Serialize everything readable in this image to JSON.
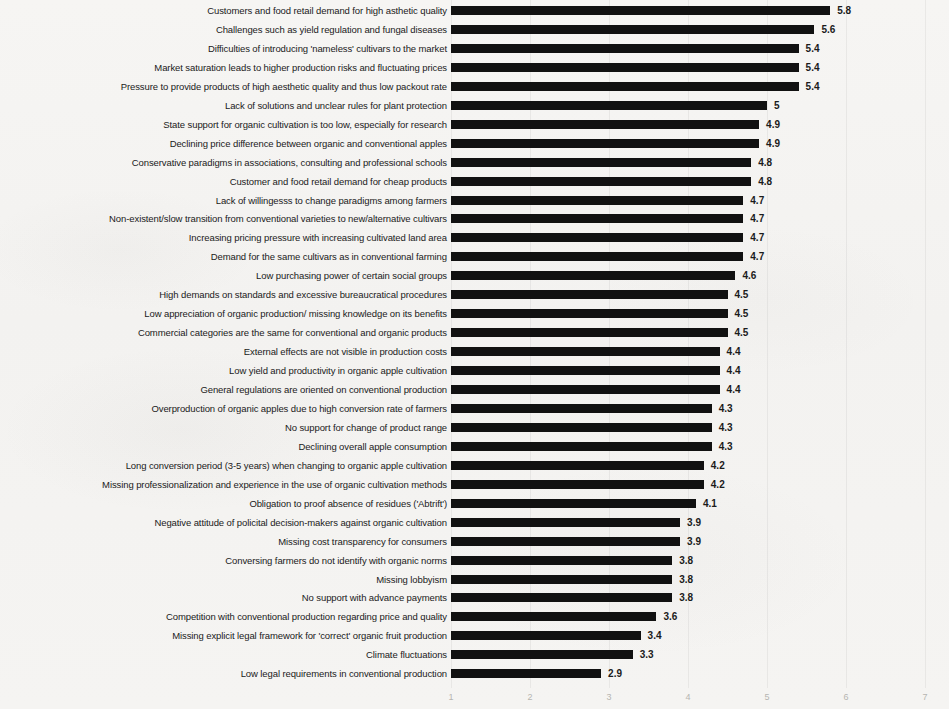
{
  "chart_data": {
    "type": "bar",
    "orientation": "horizontal",
    "title": "",
    "subtitle": "",
    "xlabel": "",
    "ylabel": "",
    "xlim": [
      0,
      7
    ],
    "x_ticks": [
      1,
      2,
      3,
      4,
      5,
      6,
      7
    ],
    "x_tick_labels": [
      "1",
      "2",
      "3",
      "4",
      "5",
      "6",
      "7"
    ],
    "grid": false,
    "legend": null,
    "bar_color": "#111111",
    "value_labels_shown": true,
    "bars_start_at_value": 1,
    "categories": [
      "Customers and food retail demand for high asthetic quality",
      "Challenges such as yield regulation and fungal diseases",
      "Difficulties of introducing 'nameless' cultivars to the market",
      "Market saturation leads to higher production risks and fluctuating prices",
      "Pressure to provide products of high aesthetic quality and thus low packout rate",
      "Lack of solutions and unclear rules for plant protection",
      "State support for organic cultivation is too low, especially for research",
      "Declining price difference between organic and conventional apples",
      "Conservative paradigms in associations, consulting and professional schools",
      "Customer and food retail demand for cheap products",
      "Lack of willingesss to change paradigms among farmers",
      "Non-existent/slow transition from conventional varieties to new/alternative cultivars",
      "Increasing pricing pressure with increasing cultivated land area",
      "Demand for the same cultivars as in conventional farming",
      "Low purchasing power of certain social groups",
      "High demands on standards and excessive bureaucratical procedures",
      "Low appreciation of organic production/ missing knowledge on its benefits",
      "Commercial categories are the same for conventional and organic products",
      "External effects are not visible in production costs",
      "Low yield and productivity in organic apple cultivation",
      "General regulations are oriented on conventional production",
      "Overproduction of organic apples due to high conversion rate of farmers",
      "No support for change of product range",
      "Declining overall apple consumption",
      "Long conversion period (3-5 years) when changing to organic apple cultivation",
      "Missing professionalization and experience in the use of organic cultivation methods",
      "Obligation to proof absence of residues ('Abtrift')",
      "Negative attitude of policital decision-makers against organic cultivation",
      "Missing cost transparency for consumers",
      "Conversing farmers do not identify with organic norms",
      "Missing lobbyism",
      "No support with advance payments",
      "Competition with conventional production  regarding price and quality",
      "Missing explicit legal framework for 'correct' organic fruit production",
      "Climate fluctuations",
      "Low legal requirements in conventional production"
    ],
    "values": [
      5.8,
      5.6,
      5.4,
      5.4,
      5.4,
      5,
      4.9,
      4.9,
      4.8,
      4.8,
      4.7,
      4.7,
      4.7,
      4.7,
      4.6,
      4.5,
      4.5,
      4.5,
      4.4,
      4.4,
      4.4,
      4.3,
      4.3,
      4.3,
      4.2,
      4.2,
      4.1,
      3.9,
      3.9,
      3.8,
      3.8,
      3.8,
      3.6,
      3.4,
      3.3,
      2.9
    ],
    "value_labels": [
      "5.8",
      "5.6",
      "5.4",
      "5.4",
      "5.4",
      "5",
      "4.9",
      "4.9",
      "4.8",
      "4.8",
      "4.7",
      "4.7",
      "4.7",
      "4.7",
      "4.6",
      "4.5",
      "4.5",
      "4.5",
      "4.4",
      "4.4",
      "4.4",
      "4.3",
      "4.3",
      "4.3",
      "4.2",
      "4.2",
      "4.1",
      "3.9",
      "3.9",
      "3.8",
      "3.8",
      "3.8",
      "3.6",
      "3.4",
      "3.3",
      "2.9"
    ]
  }
}
